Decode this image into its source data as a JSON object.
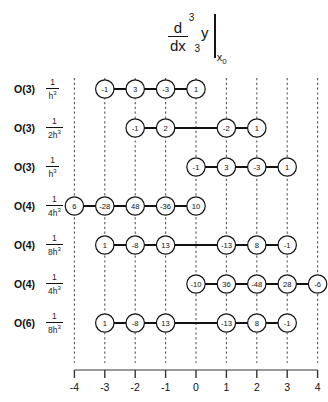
{
  "figure": {
    "title": {
      "numerator": "d",
      "numerator_exponent": "3",
      "denominator": "dx",
      "denominator_exponent": "3",
      "variable": "y",
      "evaluated_at": "x",
      "evaluated_at_subscript": "0"
    },
    "axis": {
      "ticks": [
        -4,
        -3,
        -2,
        -1,
        0,
        1,
        2,
        3,
        4
      ],
      "tick_labels": [
        "-4",
        "-3",
        "-2",
        "-1",
        "0",
        "1",
        "2",
        "3",
        "4"
      ],
      "min": -4,
      "max": 4
    },
    "colors": {
      "node_stroke": "#111111",
      "node_fill": "#ffffff",
      "connector": "#111111",
      "gridline": "#555555",
      "axis": "#777777",
      "text": "#111111"
    },
    "rows": [
      {
        "order_label": "O(3)",
        "coefficient_numerator": "1",
        "coefficient_denominator": "h",
        "coefficient_denominator_exponent": "3",
        "points": [
          {
            "x": -3,
            "value": "-1"
          },
          {
            "x": -2,
            "value": "3"
          },
          {
            "x": -1,
            "value": "-3"
          },
          {
            "x": 0,
            "value": "1"
          }
        ]
      },
      {
        "order_label": "O(3)",
        "coefficient_numerator": "1",
        "coefficient_denominator": "2h",
        "coefficient_denominator_exponent": "3",
        "points": [
          {
            "x": -2,
            "value": "-1"
          },
          {
            "x": -1,
            "value": "2"
          },
          {
            "x": 1,
            "value": "-2"
          },
          {
            "x": 2,
            "value": "1"
          }
        ]
      },
      {
        "order_label": "O(3)",
        "coefficient_numerator": "1",
        "coefficient_denominator": "h",
        "coefficient_denominator_exponent": "3",
        "points": [
          {
            "x": 0,
            "value": "-1"
          },
          {
            "x": 1,
            "value": "3"
          },
          {
            "x": 2,
            "value": "-3"
          },
          {
            "x": 3,
            "value": "1"
          }
        ]
      },
      {
        "order_label": "O(4)",
        "coefficient_numerator": "1",
        "coefficient_denominator": "4h",
        "coefficient_denominator_exponent": "3",
        "points": [
          {
            "x": -4,
            "value": "6"
          },
          {
            "x": -3,
            "value": "-28"
          },
          {
            "x": -2,
            "value": "48"
          },
          {
            "x": -1,
            "value": "-36"
          },
          {
            "x": 0,
            "value": "10"
          }
        ]
      },
      {
        "order_label": "O(4)",
        "coefficient_numerator": "1",
        "coefficient_denominator": "8h",
        "coefficient_denominator_exponent": "3",
        "points": [
          {
            "x": -3,
            "value": "1"
          },
          {
            "x": -2,
            "value": "-8"
          },
          {
            "x": -1,
            "value": "13"
          },
          {
            "x": 1,
            "value": "-13"
          },
          {
            "x": 2,
            "value": "8"
          },
          {
            "x": 3,
            "value": "-1"
          }
        ]
      },
      {
        "order_label": "O(4)",
        "coefficient_numerator": "1",
        "coefficient_denominator": "4h",
        "coefficient_denominator_exponent": "3",
        "points": [
          {
            "x": 0,
            "value": "-10"
          },
          {
            "x": 1,
            "value": "36"
          },
          {
            "x": 2,
            "value": "-48"
          },
          {
            "x": 3,
            "value": "28"
          },
          {
            "x": 4,
            "value": "-6"
          }
        ]
      },
      {
        "order_label": "O(6)",
        "coefficient_numerator": "1",
        "coefficient_denominator": "8h",
        "coefficient_denominator_exponent": "3",
        "points": [
          {
            "x": -3,
            "value": "1"
          },
          {
            "x": -2,
            "value": "-8"
          },
          {
            "x": -1,
            "value": "13"
          },
          {
            "x": 1,
            "value": "-13"
          },
          {
            "x": 2,
            "value": "8"
          },
          {
            "x": 3,
            "value": "-1"
          }
        ]
      }
    ]
  },
  "chart_data": {
    "type": "table",
    "xlabel": "",
    "ylabel": "",
    "xlim": [
      -4,
      4
    ],
    "grid": true,
    "legend_position": "none",
    "categories": [
      "-4",
      "-3",
      "-2",
      "-1",
      "0",
      "1",
      "2",
      "3",
      "4"
    ],
    "series": [
      {
        "name": "O(3) 1/h^3",
        "values": [
          null,
          -1,
          3,
          -3,
          1,
          null,
          null,
          null,
          null
        ]
      },
      {
        "name": "O(3) 1/2h^3",
        "values": [
          null,
          null,
          -1,
          2,
          null,
          -2,
          1,
          null,
          null
        ]
      },
      {
        "name": "O(3) 1/h^3",
        "values": [
          null,
          null,
          null,
          null,
          -1,
          3,
          -3,
          1,
          null
        ]
      },
      {
        "name": "O(4) 1/4h^3",
        "values": [
          6,
          -28,
          48,
          -36,
          10,
          null,
          null,
          null,
          null
        ]
      },
      {
        "name": "O(4) 1/8h^3",
        "values": [
          null,
          1,
          -8,
          13,
          null,
          -13,
          8,
          -1,
          null
        ]
      },
      {
        "name": "O(4) 1/4h^3",
        "values": [
          null,
          null,
          null,
          null,
          -10,
          36,
          -48,
          28,
          -6
        ]
      },
      {
        "name": "O(6) 1/8h^3",
        "values": [
          null,
          1,
          -8,
          13,
          null,
          -13,
          8,
          -1,
          null
        ]
      }
    ]
  }
}
